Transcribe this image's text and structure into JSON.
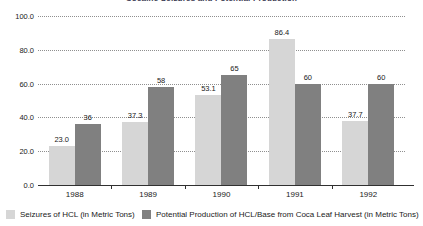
{
  "chart_data": {
    "type": "bar",
    "title": "Cocaine Seizures and Potential Production",
    "xlabel": "",
    "ylabel": "",
    "categories": [
      "1988",
      "1989",
      "1990",
      "1991",
      "1992"
    ],
    "ylim": [
      0,
      100
    ],
    "yticks": [
      "0.0",
      "20.0",
      "40.0",
      "60.0",
      "80.0",
      "100.0"
    ],
    "ytick_values": [
      0,
      20,
      40,
      60,
      80,
      100
    ],
    "grid": true,
    "legend_position": "bottom",
    "series": [
      {
        "name": "Seizures of HCL (in Metric Tons)",
        "color": "#d6d6d6",
        "values": [
          23.0,
          37.3,
          53.1,
          86.4,
          37.7
        ],
        "labels": [
          "23.0",
          "37.3",
          "53.1",
          "86.4",
          "37.7"
        ]
      },
      {
        "name": "Potential Production of HCL/Base from Coca Leaf Harvest  (in Metric Tons)",
        "color": "#808080",
        "values": [
          36,
          58,
          65,
          60,
          60
        ],
        "labels": [
          "36",
          "58",
          "65",
          "60",
          "60"
        ]
      }
    ]
  },
  "legend": {
    "items": [
      {
        "label": "Seizures of HCL (in Metric Tons)",
        "color": "#d6d6d6"
      },
      {
        "label": "Potential Production of HCL/Base from Coca Leaf Harvest  (in Metric Tons)",
        "color": "#808080"
      }
    ]
  },
  "colors": {
    "series_light": "#d6d6d6",
    "series_dark": "#808080",
    "gridline": "#8f8f8f",
    "axis": "#303030",
    "text": "#1a1a1a"
  }
}
